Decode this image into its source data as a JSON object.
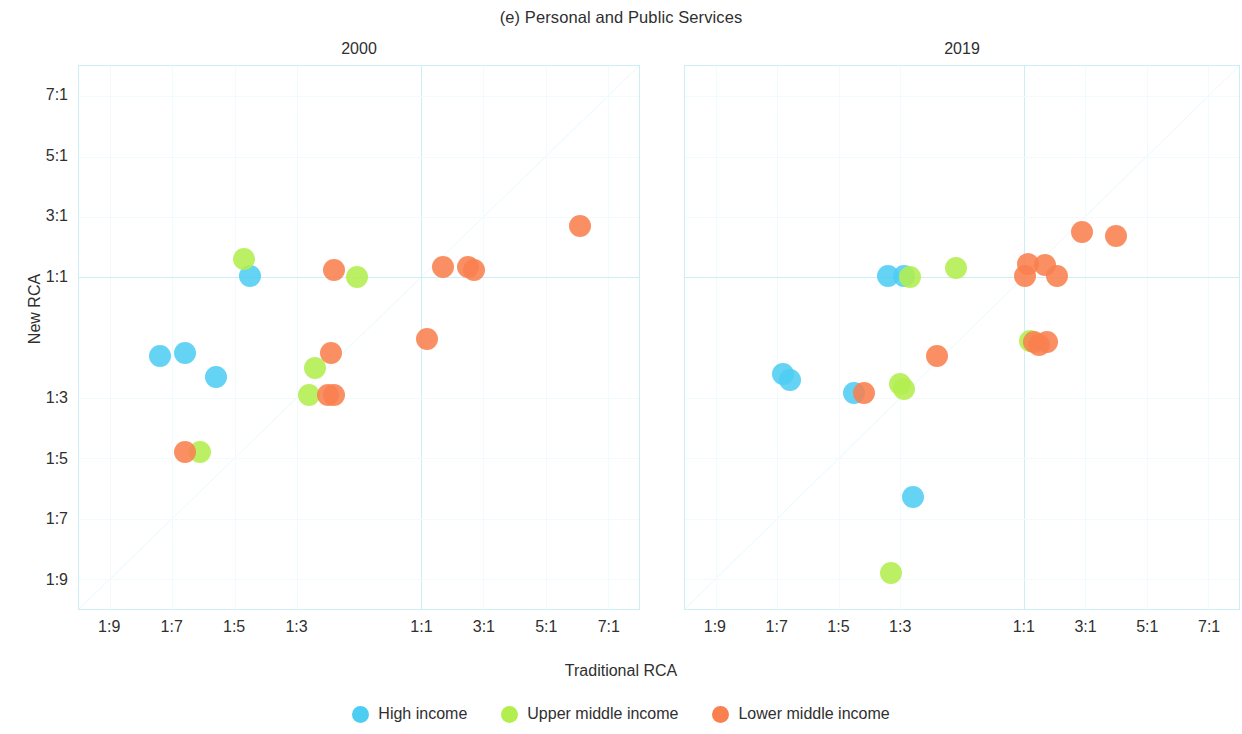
{
  "figure": {
    "title": "(e) Personal and Public Services",
    "xlabel": "Traditional RCA",
    "ylabel": "New RCA"
  },
  "legend": {
    "items": [
      {
        "label": "High income",
        "color": "#4ECDF2"
      },
      {
        "label": "Upper middle income",
        "color": "#B3EE4F"
      },
      {
        "label": "Lower middle income",
        "color": "#F9804F"
      }
    ]
  },
  "chart_data": {
    "type": "scatter",
    "title": "(e) Personal and Public Services",
    "xlabel": "Traditional RCA",
    "ylabel": "New RCA",
    "grid": true,
    "legend_position": "bottom",
    "axis_scale": "symmetric-ratio",
    "xlim": [
      -10,
      8
    ],
    "ylim": [
      -10,
      8
    ],
    "xticks": [
      "1:9",
      "1:7",
      "1:5",
      "1:3",
      "1:1",
      "3:1",
      "5:1",
      "7:1"
    ],
    "xtick_values": [
      -9,
      -7,
      -5,
      -3,
      1,
      3,
      5,
      7
    ],
    "yticks": [
      "7:1",
      "5:1",
      "3:1",
      "1:1",
      "1:3",
      "1:5",
      "1:7",
      "1:9"
    ],
    "ytick_values": [
      7,
      5,
      3,
      1,
      -3,
      -5,
      -7,
      -9
    ],
    "reference_line": {
      "type": "identity",
      "label": "y = x"
    },
    "panels": [
      {
        "title": "2000",
        "points": [
          {
            "x": -7.4,
            "y": -1.6,
            "group": "High income"
          },
          {
            "x": -6.6,
            "y": -1.5,
            "group": "High income"
          },
          {
            "x": -5.6,
            "y": -2.3,
            "group": "High income"
          },
          {
            "x": -4.5,
            "y": 1.05,
            "group": "High income"
          },
          {
            "x": -4.7,
            "y": 1.6,
            "group": "Upper middle income"
          },
          {
            "x": -6.1,
            "y": -4.8,
            "group": "Upper middle income"
          },
          {
            "x": -6.6,
            "y": -4.8,
            "group": "Lower middle income"
          },
          {
            "x": -2.4,
            "y": -2.0,
            "group": "Upper middle income"
          },
          {
            "x": -2.6,
            "y": -2.9,
            "group": "Upper middle income"
          },
          {
            "x": -2.0,
            "y": -2.9,
            "group": "Lower middle income"
          },
          {
            "x": -1.8,
            "y": -2.9,
            "group": "Lower middle income"
          },
          {
            "x": -1.9,
            "y": -1.5,
            "group": "Lower middle income"
          },
          {
            "x": -1.8,
            "y": 1.25,
            "group": "Lower middle income"
          },
          {
            "x": -1.05,
            "y": 1.02,
            "group": "Upper middle income"
          },
          {
            "x": 1.2,
            "y": -1.05,
            "group": "Lower middle income"
          },
          {
            "x": 1.7,
            "y": 1.35,
            "group": "Lower middle income"
          },
          {
            "x": 2.5,
            "y": 1.35,
            "group": "Lower middle income"
          },
          {
            "x": 2.7,
            "y": 1.25,
            "group": "Lower middle income"
          },
          {
            "x": 6.1,
            "y": 2.7,
            "group": "Lower middle income"
          }
        ]
      },
      {
        "title": "2019",
        "points": [
          {
            "x": -6.8,
            "y": -2.2,
            "group": "High income"
          },
          {
            "x": -6.6,
            "y": -2.4,
            "group": "High income"
          },
          {
            "x": -4.5,
            "y": -2.85,
            "group": "High income"
          },
          {
            "x": -4.2,
            "y": -2.85,
            "group": "Lower middle income"
          },
          {
            "x": -3.4,
            "y": 1.05,
            "group": "High income"
          },
          {
            "x": -2.9,
            "y": 1.05,
            "group": "High income"
          },
          {
            "x": -2.7,
            "y": 1.02,
            "group": "Upper middle income"
          },
          {
            "x": -3.0,
            "y": -2.55,
            "group": "Upper middle income"
          },
          {
            "x": -2.9,
            "y": -2.7,
            "group": "Upper middle income"
          },
          {
            "x": -2.6,
            "y": -6.3,
            "group": "High income"
          },
          {
            "x": -3.3,
            "y": -8.8,
            "group": "Upper middle income"
          },
          {
            "x": -1.8,
            "y": -1.6,
            "group": "Lower middle income"
          },
          {
            "x": -1.2,
            "y": 1.3,
            "group": "Upper middle income"
          },
          {
            "x": 1.05,
            "y": 1.05,
            "group": "Lower middle income"
          },
          {
            "x": 1.15,
            "y": 1.45,
            "group": "Lower middle income"
          },
          {
            "x": 1.2,
            "y": -1.1,
            "group": "Upper middle income"
          },
          {
            "x": 1.35,
            "y": -1.15,
            "group": "Lower middle income"
          },
          {
            "x": 1.5,
            "y": -1.25,
            "group": "Lower middle income"
          },
          {
            "x": 1.7,
            "y": 1.4,
            "group": "Lower middle income"
          },
          {
            "x": 1.75,
            "y": -1.15,
            "group": "Lower middle income"
          },
          {
            "x": 2.1,
            "y": 1.05,
            "group": "Lower middle income"
          },
          {
            "x": 2.9,
            "y": 2.5,
            "group": "Lower middle income"
          },
          {
            "x": 4.0,
            "y": 2.35,
            "group": "Lower middle income"
          }
        ]
      }
    ]
  }
}
